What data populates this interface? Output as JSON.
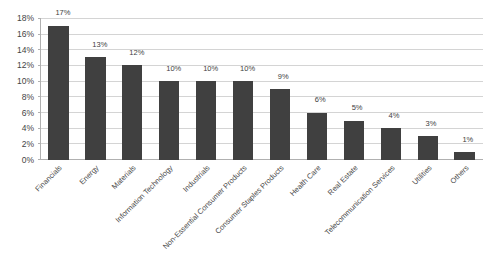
{
  "chart_data": {
    "type": "bar",
    "title": "",
    "xlabel": "",
    "ylabel": "",
    "ylim": [
      0,
      18
    ],
    "grid": true,
    "legend": "none",
    "orientation": "vertical",
    "bar_color": "#404040",
    "gridline_color": "#d4d4d4",
    "axis_color": "#b0b0b0",
    "y_ticks": [
      "0%",
      "2%",
      "4%",
      "6%",
      "8%",
      "10%",
      "12%",
      "14%",
      "16%",
      "18%"
    ],
    "y_tick_values": [
      0,
      2,
      4,
      6,
      8,
      10,
      12,
      14,
      16,
      18
    ],
    "categories": [
      "Financials",
      "Energy",
      "Materials",
      "Information Technology",
      "Industrials",
      "Non-Essential Consumer Products",
      "Consumer Staples Products",
      "Health Care",
      "Real Estate",
      "Telecommunication Services",
      "Utilities",
      "Others"
    ],
    "values": [
      17,
      13,
      12,
      10,
      10,
      10,
      9,
      6,
      5,
      4,
      3,
      1
    ],
    "value_labels": [
      "17%",
      "13%",
      "12%",
      "10%",
      "10%",
      "10%",
      "9%",
      "6%",
      "5%",
      "4%",
      "3%",
      "1%"
    ]
  }
}
